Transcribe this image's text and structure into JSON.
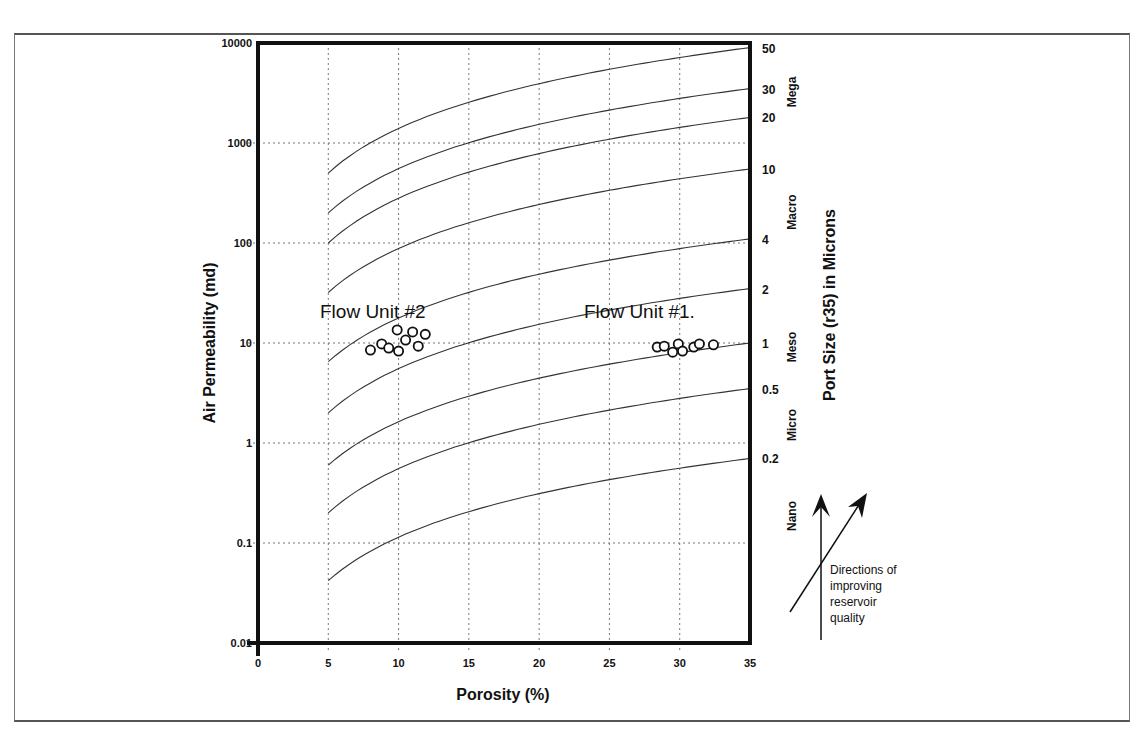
{
  "chart_data": {
    "type": "scatter",
    "title": "",
    "xlabel": "Porosity (%)",
    "ylabel": "Air Permeability (md)",
    "y2label": "Port Size (r35) in Microns",
    "xlim": [
      0,
      35
    ],
    "ylim": [
      0.01,
      10000
    ],
    "yscale": "log",
    "grid": true,
    "x_ticks": [
      "0",
      "5",
      "10",
      "15",
      "20",
      "25",
      "30",
      "35"
    ],
    "y_ticks": [
      "10000",
      "1000",
      "100",
      "10",
      "1",
      "0.1",
      "0.01"
    ],
    "pore_size_curves": [
      {
        "name": "50",
        "k_at_phi5": 500,
        "k_at_phi35": 9000
      },
      {
        "name": "30",
        "k_at_phi5": 200,
        "k_at_phi35": 3500
      },
      {
        "name": "20",
        "k_at_phi5": 100,
        "k_at_phi35": 1800
      },
      {
        "name": "10",
        "k_at_phi5": 32,
        "k_at_phi35": 550
      },
      {
        "name": "4",
        "k_at_phi5": 6.5,
        "k_at_phi35": 110
      },
      {
        "name": "2",
        "k_at_phi5": 2,
        "k_at_phi35": 35
      },
      {
        "name": "1",
        "k_at_phi5": 0.6,
        "k_at_phi35": 10
      },
      {
        "name": "0.5",
        "k_at_phi5": 0.2,
        "k_at_phi35": 3.5
      },
      {
        "name": "0.2",
        "k_at_phi5": 0.042,
        "k_at_phi35": 0.7
      }
    ],
    "pore_size_zones": [
      "Mega",
      "Macro",
      "Meso",
      "Micro",
      "Nano"
    ],
    "series": [
      {
        "name": "Flow Unit #2",
        "points": [
          [
            8.0,
            8.5
          ],
          [
            8.8,
            9.8
          ],
          [
            9.3,
            8.9
          ],
          [
            9.9,
            13.5
          ],
          [
            10.0,
            8.3
          ],
          [
            10.5,
            10.7
          ],
          [
            11.0,
            12.9
          ],
          [
            11.4,
            9.3
          ],
          [
            11.9,
            12.2
          ]
        ]
      },
      {
        "name": "Flow Unit #1",
        "points": [
          [
            28.4,
            9.1
          ],
          [
            28.9,
            9.3
          ],
          [
            29.5,
            8.1
          ],
          [
            29.9,
            9.8
          ],
          [
            30.2,
            8.3
          ],
          [
            31.0,
            9.1
          ],
          [
            31.4,
            9.8
          ],
          [
            32.4,
            9.6
          ]
        ]
      }
    ],
    "annotations": [
      {
        "text": "Flow Unit #2"
      },
      {
        "text": "Flow Unit #1"
      },
      {
        "text": "Directions of improving reservoir quality"
      }
    ]
  },
  "axes": {
    "xlabel": "Porosity (%)",
    "ylabel": "Air Permeability (md)",
    "y2label": "Port Size (r35) in Microns",
    "x_ticks": [
      "0",
      "5",
      "10",
      "15",
      "20",
      "25",
      "30",
      "35"
    ],
    "y_ticks": [
      "10000",
      "1000",
      "100",
      "10",
      "1",
      "0.1",
      "0.01"
    ],
    "right_ticks": [
      "50",
      "30",
      "20",
      "10",
      "4",
      "2",
      "1",
      "0.5",
      "0.2"
    ],
    "zones": [
      "Mega",
      "Macro",
      "Meso",
      "Micro",
      "Nano"
    ]
  },
  "labels": {
    "flow_unit_2": "Flow Unit #2",
    "flow_unit_1": "Flow Unit #1.",
    "note_line1": "Directions of",
    "note_line2": "improving",
    "note_line3": "reservoir",
    "note_line4": "quality"
  }
}
